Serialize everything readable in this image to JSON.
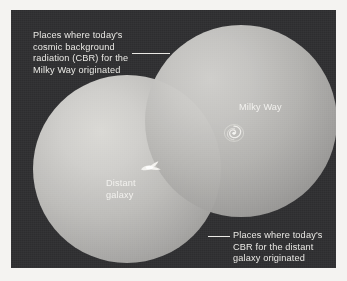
{
  "figure": {
    "background_color": "#f4f3f1",
    "panel_color": "#2d2d2f",
    "text_color": "#e9e8e4"
  },
  "callouts": [
    {
      "id": "cbr-milky-way",
      "text": "Places where today's\ncosmic background\nradiation (CBR) for the\nMilky Way originated",
      "leader": "leader-line-top"
    },
    {
      "id": "cbr-distant-galaxy",
      "text": "Places where today's\nCBR for the distant\ngalaxy originated",
      "leader": "leader-line-bottom"
    }
  ],
  "objects": [
    {
      "id": "milky-way",
      "label": "Milky Way",
      "glyph": "spiral-galaxy-icon",
      "sphere_color": "#b6b5b2"
    },
    {
      "id": "distant-galaxy",
      "label": "Distant\ngalaxy",
      "glyph": "irregular-galaxy-icon",
      "sphere_color": "#bcbbb8"
    }
  ],
  "spheres": {
    "distant_galaxy_sphere": {
      "name": "CBR origin sphere for the distant galaxy",
      "highlight_color": "#d9d8d4",
      "shadow_color": "#888785"
    },
    "milky_way_sphere": {
      "name": "CBR origin sphere for the Milky Way",
      "highlight_color": "#d3d2cf",
      "shadow_color": "#848381"
    },
    "overlap": {
      "name": "Region visible to both",
      "color": "#6e6d6b"
    }
  }
}
